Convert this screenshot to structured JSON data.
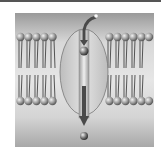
{
  "diagram": {
    "elements": {
      "bilayer_left_count": 5,
      "bilayer_right_count": 5,
      "channel": "transmembrane channel protein (ellipse)",
      "arrow": "solute path downward through channel",
      "solute_top": "molecule entering channel",
      "solute_bottom": "molecule exiting channel"
    },
    "colors": {
      "background_dark": "#9a9a9a",
      "background_light": "#e6e6e6",
      "lipid_head": "#9c9c9c",
      "tail": "#444444",
      "channel_fill": "#cfcfcf",
      "arrow": "#4a4a4a"
    },
    "caption": ""
  }
}
